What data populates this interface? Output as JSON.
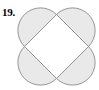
{
  "label": {
    "number": "19."
  },
  "figure": {
    "name": "quatrefoil-four-semicircles-on-square",
    "colors": {
      "petal_fill": "#e9e9e9",
      "square_fill": "#ffffff",
      "stroke": "#8c8c8c",
      "background": "#ffffff",
      "label_color": "#000000"
    },
    "geometry": {
      "square_center_x": 56.5,
      "square_center_y": 46.5,
      "square_half_diagonal": 32,
      "square_side_length": 45.25,
      "semicircle_radius": 22.6,
      "petal_count": 4,
      "vertices": [
        {
          "name": "top",
          "x": 56.5,
          "y": 14.5
        },
        {
          "name": "right",
          "x": 88.5,
          "y": 46.5
        },
        {
          "name": "bottom",
          "x": 56.5,
          "y": 78.5
        },
        {
          "name": "left",
          "x": 24.5,
          "y": 46.5
        }
      ],
      "petals": [
        {
          "name": "top-left-petal",
          "center_x": 40.5,
          "center_y": 30.5
        },
        {
          "name": "top-right-petal",
          "center_x": 72.5,
          "center_y": 30.5
        },
        {
          "name": "bottom-right-petal",
          "center_x": 72.5,
          "center_y": 62.5
        },
        {
          "name": "bottom-left-petal",
          "center_x": 40.5,
          "center_y": 62.5
        }
      ],
      "stroke_width": 0.9
    }
  }
}
